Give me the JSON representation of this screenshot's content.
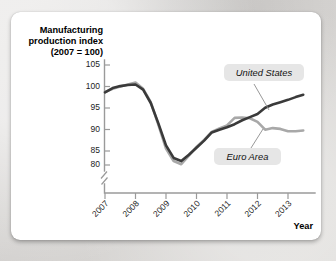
{
  "card": {
    "background_color": "#ffffff",
    "page_background_color": "#d9d9d7"
  },
  "chart_data": {
    "type": "line",
    "title": "",
    "ylabel_line1": "Manufacturing",
    "ylabel_line2": "production index",
    "ylabel_line3": "(2007 = 100)",
    "xlabel": "Year",
    "ylim": [
      78,
      106
    ],
    "xlim": [
      2007,
      2013.75
    ],
    "grid": false,
    "axis_break": true,
    "yticks": [
      105,
      100,
      95,
      90,
      85,
      80
    ],
    "ytick_labels": [
      "105",
      "100",
      "95",
      "90",
      "85",
      "80"
    ],
    "xticks": [
      2007,
      2008,
      2009,
      2010,
      2011,
      2012,
      2013
    ],
    "xtick_labels": [
      "2007",
      "2008",
      "2009",
      "2010",
      "2011",
      "2012",
      "2013"
    ],
    "legend_position": "inline-callouts",
    "series": [
      {
        "name": "United States",
        "color": "#3a3a3a",
        "x": [
          2007.0,
          2007.25,
          2007.5,
          2007.75,
          2008.0,
          2008.25,
          2008.5,
          2008.75,
          2009.0,
          2009.25,
          2009.5,
          2009.75,
          2010.0,
          2010.25,
          2010.5,
          2010.75,
          2011.0,
          2011.25,
          2011.5,
          2011.75,
          2012.0,
          2012.25,
          2012.5,
          2012.75,
          2013.0,
          2013.25,
          2013.5
        ],
        "values": [
          98.5,
          99.6,
          100.1,
          100.4,
          100.5,
          99.2,
          95.8,
          90.6,
          85.0,
          81.8,
          81.0,
          82.6,
          84.4,
          86.2,
          88.3,
          89.0,
          89.6,
          90.4,
          91.4,
          92.2,
          93.0,
          94.6,
          95.4,
          96.0,
          96.6,
          97.3,
          97.9
        ]
      },
      {
        "name": "Euro Area",
        "color": "#a8a8a8",
        "x": [
          2007.0,
          2007.25,
          2007.5,
          2007.75,
          2008.0,
          2008.25,
          2008.5,
          2008.75,
          2009.0,
          2009.25,
          2009.5,
          2009.75,
          2010.0,
          2010.25,
          2010.5,
          2010.75,
          2011.0,
          2011.25,
          2011.5,
          2011.75,
          2012.0,
          2012.25,
          2012.5,
          2012.75,
          2013.0,
          2013.25,
          2013.5
        ],
        "values": [
          98.6,
          99.4,
          100.0,
          100.5,
          101.0,
          99.4,
          96.0,
          90.2,
          84.2,
          81.0,
          80.2,
          82.4,
          84.6,
          86.4,
          88.4,
          89.3,
          90.1,
          92.0,
          92.1,
          91.9,
          91.0,
          89.0,
          89.4,
          89.2,
          88.6,
          88.6,
          88.8
        ]
      }
    ],
    "annotations": [
      {
        "label": "United States",
        "target_series": "United States"
      },
      {
        "label": "Euro Area",
        "target_series": "Euro Area"
      }
    ]
  }
}
